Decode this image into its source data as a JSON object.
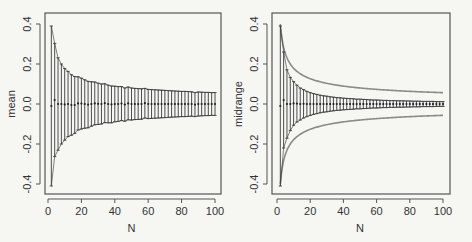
{
  "colors": {
    "background": "#f6f6f3",
    "frame": "#555555",
    "bars": "#3a3a3a",
    "points": "#222222",
    "reference_curve": "#8a8a8a"
  },
  "chart_data": [
    {
      "type": "scatter",
      "title": "",
      "xlabel": "N",
      "ylabel": "mean",
      "xlim": [
        0,
        100
      ],
      "ylim": [
        -0.42,
        0.45
      ],
      "xticks": [
        0,
        20,
        40,
        60,
        80,
        100
      ],
      "yticks": [
        -0.4,
        -0.2,
        0.0,
        0.2,
        0.4
      ],
      "ytick_labels": [
        "-0.4",
        "-0.2",
        "0.0",
        "0.2",
        "0.4"
      ],
      "grid": false,
      "legend": null,
      "series": [
        {
          "name": "mean estimate with error bars",
          "x": [
            2,
            4,
            6,
            8,
            10,
            12,
            14,
            16,
            18,
            20,
            22,
            24,
            26,
            28,
            30,
            32,
            34,
            36,
            38,
            40,
            42,
            44,
            46,
            48,
            50,
            52,
            54,
            56,
            58,
            60,
            62,
            64,
            66,
            68,
            70,
            72,
            74,
            76,
            78,
            80,
            82,
            84,
            86,
            88,
            90,
            92,
            94,
            96,
            98,
            100
          ],
          "y": [
            -0.01,
            0.02,
            0.0,
            0.0,
            -0.002,
            0.0,
            -0.005,
            -0.005,
            0.003,
            0.002,
            0.0,
            -0.003,
            0.0,
            0.003,
            0.001,
            0.0,
            0.004,
            0.0,
            -0.002,
            0.0,
            0.0,
            0.002,
            -0.003,
            0.003,
            0.0,
            0.0,
            0.0,
            0.0,
            0.004,
            0.0,
            0.0,
            0.0,
            0.0,
            0.0,
            0.0,
            0.0,
            0.0,
            0.0,
            0.0,
            0.0,
            0.0,
            0.0,
            0.0,
            -0.003,
            0.0,
            0.0,
            0.0,
            0.0,
            0.0,
            0.0
          ],
          "error_halfwidth_formula": "0.566/sqrt(N)",
          "error_halfwidth": [
            0.4,
            0.283,
            0.231,
            0.2,
            0.179,
            0.163,
            0.151,
            0.142,
            0.133,
            0.127,
            0.121,
            0.116,
            0.111,
            0.107,
            0.103,
            0.1,
            0.097,
            0.094,
            0.092,
            0.089,
            0.087,
            0.085,
            0.083,
            0.082,
            0.08,
            0.078,
            0.077,
            0.076,
            0.074,
            0.073,
            0.072,
            0.071,
            0.07,
            0.069,
            0.068,
            0.067,
            0.066,
            0.065,
            0.064,
            0.063,
            0.063,
            0.062,
            0.061,
            0.06,
            0.06,
            0.059,
            0.058,
            0.058,
            0.057,
            0.057
          ]
        }
      ]
    },
    {
      "type": "scatter",
      "title": "",
      "xlabel": "N",
      "ylabel": "midrange",
      "xlim": [
        0,
        100
      ],
      "ylim": [
        -0.42,
        0.45
      ],
      "xticks": [
        0,
        20,
        40,
        60,
        80,
        100
      ],
      "yticks": [
        -0.4,
        -0.2,
        0.0,
        0.2,
        0.4
      ],
      "ytick_labels": [
        "-0.4",
        "-0.2",
        "0.0",
        "0.2",
        "0.4"
      ],
      "grid": false,
      "legend": null,
      "series": [
        {
          "name": "midrange estimate with error bars",
          "x": [
            2,
            4,
            6,
            8,
            10,
            12,
            14,
            16,
            18,
            20,
            22,
            24,
            26,
            28,
            30,
            32,
            34,
            36,
            38,
            40,
            42,
            44,
            46,
            48,
            50,
            52,
            54,
            56,
            58,
            60,
            62,
            64,
            66,
            68,
            70,
            72,
            74,
            76,
            78,
            80,
            82,
            84,
            86,
            88,
            90,
            92,
            94,
            96,
            98,
            100
          ],
          "y": [
            -0.01,
            0.02,
            0.0,
            0.0,
            0.003,
            0.002,
            0.0,
            0.001,
            0.0,
            0.0,
            0.0,
            0.0,
            0.0,
            0.0,
            0.0,
            0.0,
            0.0,
            0.0,
            0.0,
            0.0,
            0.0,
            0.0,
            0.0,
            0.0,
            0.0,
            0.0,
            0.0,
            0.0,
            0.0,
            0.0,
            0.0,
            0.0,
            0.0,
            0.0,
            0.0,
            0.0,
            0.0,
            0.0,
            0.0,
            0.0,
            0.0,
            0.0,
            0.0,
            0.0,
            0.0,
            0.0,
            0.0,
            0.0,
            0.0,
            0.0
          ],
          "error_halfwidth_formula": "1.2/(N+1)",
          "error_halfwidth": [
            0.4,
            0.24,
            0.171,
            0.133,
            0.109,
            0.092,
            0.08,
            0.071,
            0.063,
            0.057,
            0.052,
            0.048,
            0.044,
            0.041,
            0.039,
            0.036,
            0.034,
            0.032,
            0.031,
            0.029,
            0.028,
            0.027,
            0.026,
            0.024,
            0.024,
            0.023,
            0.022,
            0.021,
            0.02,
            0.02,
            0.019,
            0.018,
            0.018,
            0.017,
            0.017,
            0.016,
            0.016,
            0.016,
            0.015,
            0.015,
            0.014,
            0.014,
            0.014,
            0.013,
            0.013,
            0.013,
            0.013,
            0.012,
            0.012,
            0.012
          ]
        },
        {
          "name": "reference envelope (mean error, ±0.566/sqrt(N))",
          "style": "gray curve",
          "formula": "±0.566/sqrt(N)"
        }
      ]
    }
  ],
  "panels": [
    {
      "frame": {
        "x0": 45,
        "y0": 13,
        "x1": 221,
        "y1": 194
      },
      "xpix": {
        "at0": 48,
        "at100": 215
      },
      "ypix": {
        "zero": 104,
        "per_unit": 200
      }
    },
    {
      "frame": {
        "x0": 272,
        "y0": 13,
        "x1": 450,
        "y1": 194
      },
      "xpix": {
        "at0": 277,
        "at100": 443
      },
      "ypix": {
        "zero": 104,
        "per_unit": 200
      }
    }
  ]
}
